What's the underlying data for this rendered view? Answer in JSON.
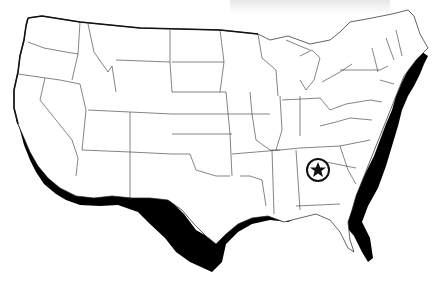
{
  "map": {
    "title": "",
    "region": "Contiguous United States",
    "style": "blank outline map with coastal shadow",
    "colors": {
      "land": "#ffffff",
      "borders": "#222222",
      "coastal_shadow": "#000000",
      "background": "#ffffff"
    },
    "marker": {
      "icon": "star-in-circle-icon",
      "location": "Georgia (Atlanta area)",
      "x": 318,
      "y": 170
    }
  }
}
